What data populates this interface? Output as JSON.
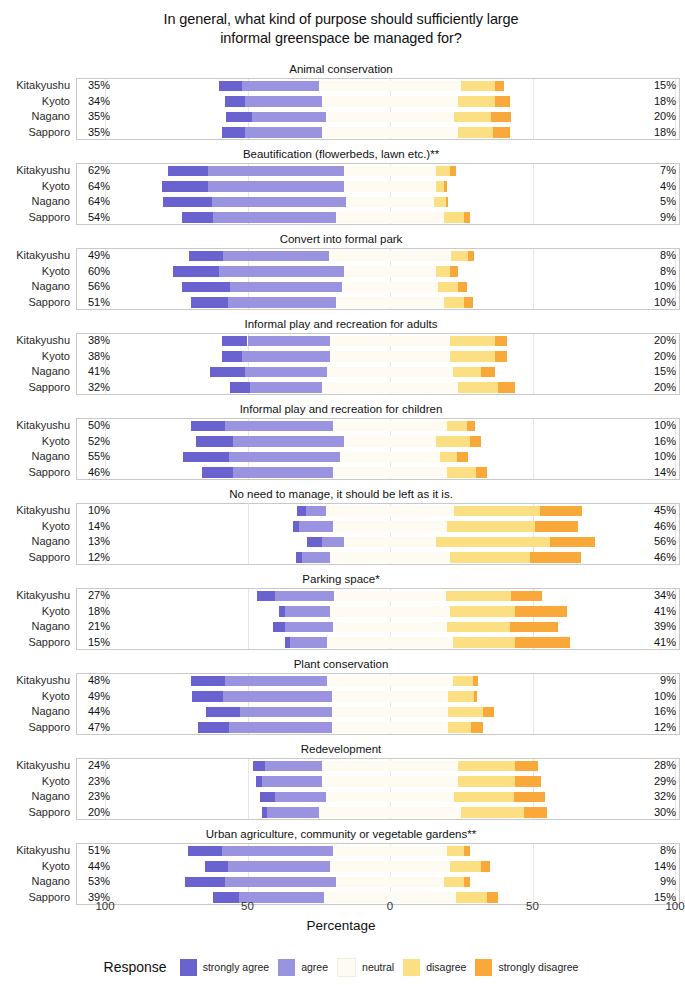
{
  "title": "In general, what kind of purpose should sufficiently large\ninformal greenspace be managed for?",
  "axis": {
    "title": "Percentage",
    "ticks": [
      {
        "label": "100",
        "value": -100
      },
      {
        "label": "50",
        "value": -50
      },
      {
        "label": "0",
        "value": 0
      },
      {
        "label": "50",
        "value": 50
      },
      {
        "label": "100",
        "value": 100
      }
    ]
  },
  "legend": {
    "title": "Response",
    "items": [
      {
        "label": "strongly agree",
        "color": "#6a63cf"
      },
      {
        "label": "agree",
        "color": "#9a93e0"
      },
      {
        "label": "neutral",
        "color": "#fdfbf2"
      },
      {
        "label": "disagree",
        "color": "#fbdf82"
      },
      {
        "label": "strongly disagree",
        "color": "#f8a93a"
      }
    ]
  },
  "cities": [
    "Kitakyushu",
    "Kyoto",
    "Nagano",
    "Sapporo"
  ],
  "chart_data": {
    "type": "bar",
    "subtype": "diverging-stacked-likert",
    "title": "In general, what kind of purpose should sufficiently large informal greenspace be managed for?",
    "xlabel": "Percentage",
    "ylabel": "",
    "xlim": [
      -100,
      100
    ],
    "grid": true,
    "legend_position": "bottom",
    "categories": [
      "Kitakyushu",
      "Kyoto",
      "Nagano",
      "Sapporo"
    ],
    "series_names": [
      "strongly agree",
      "agree",
      "neutral",
      "disagree",
      "strongly disagree"
    ],
    "panels": [
      {
        "title": "Animal conservation",
        "rows": [
          {
            "city": "Kitakyushu",
            "agree_total": "35%",
            "neutral": "50%",
            "disagree_total": "15%",
            "strongly_agree": 8,
            "agree": 27,
            "neutral_val": 50,
            "disagree": 12,
            "strongly_disagree": 3
          },
          {
            "city": "Kyoto",
            "agree_total": "34%",
            "neutral": "48%",
            "disagree_total": "18%",
            "strongly_agree": 7,
            "agree": 27,
            "neutral_val": 48,
            "disagree": 13,
            "strongly_disagree": 5
          },
          {
            "city": "Nagano",
            "agree_total": "35%",
            "neutral": "45%",
            "disagree_total": "20%",
            "strongly_agree": 9,
            "agree": 26,
            "neutral_val": 45,
            "disagree": 13,
            "strongly_disagree": 7
          },
          {
            "city": "Sapporo",
            "agree_total": "35%",
            "neutral": "48%",
            "disagree_total": "18%",
            "strongly_agree": 8,
            "agree": 27,
            "neutral_val": 48,
            "disagree": 12,
            "strongly_disagree": 6
          }
        ]
      },
      {
        "title": "Beautification (flowerbeds, lawn etc.)**",
        "rows": [
          {
            "city": "Kitakyushu",
            "agree_total": "62%",
            "neutral": "32%",
            "disagree_total": "7%",
            "strongly_agree": 14,
            "agree": 48,
            "neutral_val": 32,
            "disagree": 5,
            "strongly_disagree": 2
          },
          {
            "city": "Kyoto",
            "agree_total": "64%",
            "neutral": "32%",
            "disagree_total": "4%",
            "strongly_agree": 16,
            "agree": 48,
            "neutral_val": 32,
            "disagree": 3,
            "strongly_disagree": 1
          },
          {
            "city": "Nagano",
            "agree_total": "64%",
            "neutral": "31%",
            "disagree_total": "5%",
            "strongly_agree": 17,
            "agree": 47,
            "neutral_val": 31,
            "disagree": 4,
            "strongly_disagree": 1
          },
          {
            "city": "Sapporo",
            "agree_total": "54%",
            "neutral": "38%",
            "disagree_total": "9%",
            "strongly_agree": 11,
            "agree": 43,
            "neutral_val": 38,
            "disagree": 7,
            "strongly_disagree": 2
          }
        ]
      },
      {
        "title": "Convert into formal park",
        "rows": [
          {
            "city": "Kitakyushu",
            "agree_total": "49%",
            "neutral": "43%",
            "disagree_total": "8%",
            "strongly_agree": 12,
            "agree": 37,
            "neutral_val": 43,
            "disagree": 6,
            "strongly_disagree": 2
          },
          {
            "city": "Kyoto",
            "agree_total": "60%",
            "neutral": "32%",
            "disagree_total": "8%",
            "strongly_agree": 16,
            "agree": 44,
            "neutral_val": 32,
            "disagree": 5,
            "strongly_disagree": 3
          },
          {
            "city": "Nagano",
            "agree_total": "56%",
            "neutral": "34%",
            "disagree_total": "10%",
            "strongly_agree": 17,
            "agree": 39,
            "neutral_val": 34,
            "disagree": 7,
            "strongly_disagree": 3
          },
          {
            "city": "Sapporo",
            "agree_total": "51%",
            "neutral": "38%",
            "disagree_total": "10%",
            "strongly_agree": 13,
            "agree": 38,
            "neutral_val": 38,
            "disagree": 7,
            "strongly_disagree": 3
          }
        ]
      },
      {
        "title": "Informal play and recreation for adults",
        "rows": [
          {
            "city": "Kitakyushu",
            "agree_total": "38%",
            "neutral": "42%",
            "disagree_total": "20%",
            "strongly_agree": 9,
            "agree": 29,
            "neutral_val": 42,
            "disagree": 16,
            "strongly_disagree": 4
          },
          {
            "city": "Kyoto",
            "agree_total": "38%",
            "neutral": "42%",
            "disagree_total": "20%",
            "strongly_agree": 7,
            "agree": 31,
            "neutral_val": 42,
            "disagree": 16,
            "strongly_disagree": 4
          },
          {
            "city": "Nagano",
            "agree_total": "41%",
            "neutral": "44%",
            "disagree_total": "15%",
            "strongly_agree": 12,
            "agree": 29,
            "neutral_val": 44,
            "disagree": 10,
            "strongly_disagree": 5
          },
          {
            "city": "Sapporo",
            "agree_total": "32%",
            "neutral": "48%",
            "disagree_total": "20%",
            "strongly_agree": 7,
            "agree": 25,
            "neutral_val": 48,
            "disagree": 14,
            "strongly_disagree": 6
          }
        ]
      },
      {
        "title": "Informal play and recreation for children",
        "rows": [
          {
            "city": "Kitakyushu",
            "agree_total": "50%",
            "neutral": "40%",
            "disagree_total": "10%",
            "strongly_agree": 12,
            "agree": 38,
            "neutral_val": 40,
            "disagree": 7,
            "strongly_disagree": 3
          },
          {
            "city": "Kyoto",
            "agree_total": "52%",
            "neutral": "32%",
            "disagree_total": "16%",
            "strongly_agree": 13,
            "agree": 39,
            "neutral_val": 32,
            "disagree": 12,
            "strongly_disagree": 4
          },
          {
            "city": "Nagano",
            "agree_total": "55%",
            "neutral": "35%",
            "disagree_total": "10%",
            "strongly_agree": 16,
            "agree": 39,
            "neutral_val": 35,
            "disagree": 6,
            "strongly_disagree": 4
          },
          {
            "city": "Sapporo",
            "agree_total": "46%",
            "neutral": "40%",
            "disagree_total": "14%",
            "strongly_agree": 11,
            "agree": 35,
            "neutral_val": 40,
            "disagree": 10,
            "strongly_disagree": 4
          }
        ]
      },
      {
        "title": "No need to manage, it should be left as it is.",
        "rows": [
          {
            "city": "Kitakyushu",
            "agree_total": "10%",
            "neutral": "45%",
            "disagree_total": "45%",
            "strongly_agree": 3,
            "agree": 7,
            "neutral_val": 45,
            "disagree": 30,
            "strongly_disagree": 15
          },
          {
            "city": "Kyoto",
            "agree_total": "14%",
            "neutral": "40%",
            "disagree_total": "46%",
            "strongly_agree": 2,
            "agree": 12,
            "neutral_val": 40,
            "disagree": 31,
            "strongly_disagree": 15
          },
          {
            "city": "Nagano",
            "agree_total": "13%",
            "neutral": "32%",
            "disagree_total": "56%",
            "strongly_agree": 5,
            "agree": 8,
            "neutral_val": 32,
            "disagree": 40,
            "strongly_disagree": 16
          },
          {
            "city": "Sapporo",
            "agree_total": "12%",
            "neutral": "42%",
            "disagree_total": "46%",
            "strongly_agree": 2,
            "agree": 10,
            "neutral_val": 42,
            "disagree": 28,
            "strongly_disagree": 18
          }
        ]
      },
      {
        "title": "Parking space*",
        "rows": [
          {
            "city": "Kitakyushu",
            "agree_total": "27%",
            "neutral": "39%",
            "disagree_total": "34%",
            "strongly_agree": 6,
            "agree": 21,
            "neutral_val": 39,
            "disagree": 23,
            "strongly_disagree": 11
          },
          {
            "city": "Kyoto",
            "agree_total": "18%",
            "neutral": "42%",
            "disagree_total": "41%",
            "strongly_agree": 2,
            "agree": 16,
            "neutral_val": 42,
            "disagree": 23,
            "strongly_disagree": 18
          },
          {
            "city": "Nagano",
            "agree_total": "21%",
            "neutral": "40%",
            "disagree_total": "39%",
            "strongly_agree": 4,
            "agree": 17,
            "neutral_val": 40,
            "disagree": 22,
            "strongly_disagree": 17
          },
          {
            "city": "Sapporo",
            "agree_total": "15%",
            "neutral": "44%",
            "disagree_total": "41%",
            "strongly_agree": 2,
            "agree": 13,
            "neutral_val": 44,
            "disagree": 22,
            "strongly_disagree": 19
          }
        ]
      },
      {
        "title": "Plant conservation",
        "rows": [
          {
            "city": "Kitakyushu",
            "agree_total": "48%",
            "neutral": "44%",
            "disagree_total": "9%",
            "strongly_agree": 12,
            "agree": 36,
            "neutral_val": 44,
            "disagree": 7,
            "strongly_disagree": 2
          },
          {
            "city": "Kyoto",
            "agree_total": "49%",
            "neutral": "41%",
            "disagree_total": "10%",
            "strongly_agree": 11,
            "agree": 38,
            "neutral_val": 41,
            "disagree": 9,
            "strongly_disagree": 1
          },
          {
            "city": "Nagano",
            "agree_total": "44%",
            "neutral": "41%",
            "disagree_total": "16%",
            "strongly_agree": 12,
            "agree": 32,
            "neutral_val": 41,
            "disagree": 12,
            "strongly_disagree": 4
          },
          {
            "city": "Sapporo",
            "agree_total": "47%",
            "neutral": "41%",
            "disagree_total": "12%",
            "strongly_agree": 11,
            "agree": 36,
            "neutral_val": 41,
            "disagree": 8,
            "strongly_disagree": 4
          }
        ]
      },
      {
        "title": "Redevelopment",
        "rows": [
          {
            "city": "Kitakyushu",
            "agree_total": "24%",
            "neutral": "48%",
            "disagree_total": "28%",
            "strongly_agree": 4,
            "agree": 20,
            "neutral_val": 48,
            "disagree": 20,
            "strongly_disagree": 8
          },
          {
            "city": "Kyoto",
            "agree_total": "23%",
            "neutral": "48%",
            "disagree_total": "29%",
            "strongly_agree": 2,
            "agree": 21,
            "neutral_val": 48,
            "disagree": 20,
            "strongly_disagree": 9
          },
          {
            "city": "Nagano",
            "agree_total": "23%",
            "neutral": "45%",
            "disagree_total": "32%",
            "strongly_agree": 5,
            "agree": 18,
            "neutral_val": 45,
            "disagree": 21,
            "strongly_disagree": 11
          },
          {
            "city": "Sapporo",
            "agree_total": "20%",
            "neutral": "50%",
            "disagree_total": "30%",
            "strongly_agree": 2,
            "agree": 18,
            "neutral_val": 50,
            "disagree": 22,
            "strongly_disagree": 8
          }
        ]
      },
      {
        "title": "Urban agriculture, community or vegetable gardens**",
        "rows": [
          {
            "city": "Kitakyushu",
            "agree_total": "51%",
            "neutral": "40%",
            "disagree_total": "8%",
            "strongly_agree": 12,
            "agree": 39,
            "neutral_val": 40,
            "disagree": 6,
            "strongly_disagree": 2
          },
          {
            "city": "Kyoto",
            "agree_total": "44%",
            "neutral": "42%",
            "disagree_total": "14%",
            "strongly_agree": 8,
            "agree": 36,
            "neutral_val": 42,
            "disagree": 11,
            "strongly_disagree": 3
          },
          {
            "city": "Nagano",
            "agree_total": "53%",
            "neutral": "38%",
            "disagree_total": "9%",
            "strongly_agree": 14,
            "agree": 39,
            "neutral_val": 38,
            "disagree": 7,
            "strongly_disagree": 2
          },
          {
            "city": "Sapporo",
            "agree_total": "39%",
            "neutral": "46%",
            "disagree_total": "15%",
            "strongly_agree": 9,
            "agree": 30,
            "neutral_val": 46,
            "disagree": 11,
            "strongly_disagree": 4
          }
        ]
      }
    ]
  }
}
